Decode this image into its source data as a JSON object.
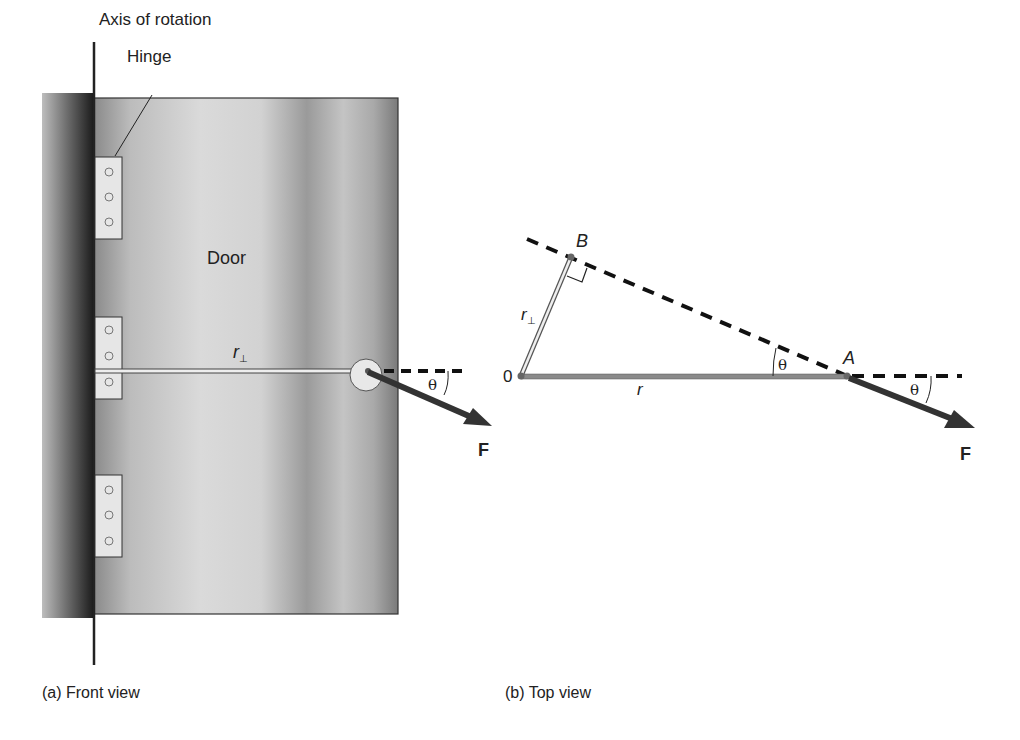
{
  "front_view": {
    "axis_label": "Axis of rotation",
    "hinge_label": "Hinge",
    "door_label": "Door",
    "r_perp_label": "r",
    "r_perp_sub": "⊥",
    "theta_label": "θ",
    "force_label": "F",
    "caption": "(a) Front view",
    "hinges": 3,
    "screws_per_hinge": 3
  },
  "top_view": {
    "point_origin": "0",
    "point_a": "A",
    "point_b": "B",
    "r_label": "r",
    "r_perp_label": "r",
    "r_perp_sub": "⊥",
    "theta_inner": "θ",
    "theta_outer": "θ",
    "force_label": "F",
    "caption": "(b) Top view"
  },
  "colors": {
    "line": "#222222",
    "wall_dark": "#1e1e1e",
    "door_light": "#d8d8d8",
    "door_dark": "#6e6e6e",
    "hinge_fill": "#e6e6e6",
    "arrow": "#333333",
    "rod": "#8a8a8a"
  }
}
